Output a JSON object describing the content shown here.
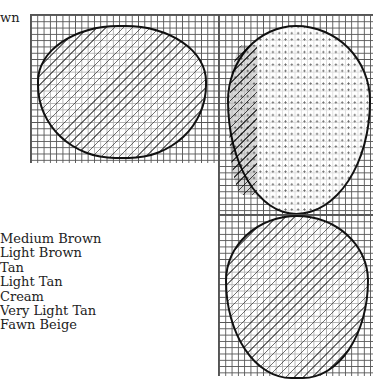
{
  "header": {
    "partial_label": "wn"
  },
  "legend": {
    "items": [
      {
        "label": "Medium Brown"
      },
      {
        "label": "Light Brown"
      },
      {
        "label": "Tan"
      },
      {
        "label": "Light Tan"
      },
      {
        "label": "Cream"
      },
      {
        "label": "Very Light Tan"
      },
      {
        "label": "Fawn Beige"
      }
    ]
  },
  "charts": [
    {
      "name": "left-oval-motif",
      "symbols": [
        "|",
        "/",
        "N",
        "-",
        "•"
      ]
    },
    {
      "name": "right-egg-motif",
      "symbols": [
        "X",
        "N",
        "/",
        "•",
        "-"
      ]
    },
    {
      "name": "bottom-oval-motif",
      "symbols": [
        "|",
        "/",
        "N",
        "-",
        "•"
      ]
    }
  ]
}
